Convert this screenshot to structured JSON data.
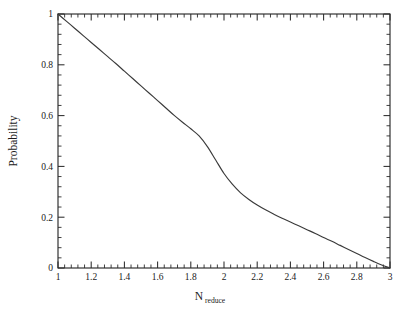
{
  "chart_data": {
    "type": "line",
    "title": "",
    "subtitle": "",
    "xlabel": "N_reduce",
    "xlabel_base": "N",
    "xlabel_subscript": "reduce",
    "ylabel": "Probability",
    "xlim": [
      1,
      3
    ],
    "ylim": [
      0,
      1
    ],
    "grid": false,
    "legend": null,
    "legend_position": "none",
    "x_ticks_major": [
      1,
      1.2,
      1.4,
      1.6,
      1.8,
      2,
      2.2,
      2.4,
      2.6,
      2.8,
      3
    ],
    "x_tick_labels": [
      "1",
      "1.2",
      "1.4",
      "1.6",
      "1.8",
      "2",
      "2.2",
      "2.4",
      "2.6",
      "2.8",
      "3"
    ],
    "x_minor_per_interval": 4,
    "y_ticks_major": [
      0,
      0.2,
      0.4,
      0.6,
      0.8,
      1
    ],
    "y_tick_labels": [
      "0",
      "0.2",
      "0.4",
      "0.6",
      "0.8",
      "1"
    ],
    "y_minor_per_interval": 4,
    "tick_direction": "in",
    "line_color": "#3a3a3a",
    "background_color": "#ffffff",
    "axis_color": "#2b2b2b",
    "series": [
      {
        "name": "Probability",
        "x": [
          1.0,
          1.05,
          1.1,
          1.15,
          1.2,
          1.25,
          1.3,
          1.35,
          1.4,
          1.45,
          1.5,
          1.55,
          1.6,
          1.65,
          1.7,
          1.75,
          1.8,
          1.85,
          1.9,
          1.95,
          2.0,
          2.05,
          2.1,
          2.15,
          2.2,
          2.25,
          2.3,
          2.35,
          2.4,
          2.45,
          2.5,
          2.55,
          2.6,
          2.65,
          2.7,
          2.75,
          2.8,
          2.85,
          2.9,
          2.95,
          3.0
        ],
        "y": [
          1.0,
          0.972,
          0.944,
          0.916,
          0.888,
          0.86,
          0.832,
          0.804,
          0.775,
          0.746,
          0.717,
          0.688,
          0.659,
          0.63,
          0.601,
          0.574,
          0.548,
          0.52,
          0.478,
          0.425,
          0.372,
          0.33,
          0.296,
          0.27,
          0.248,
          0.229,
          0.212,
          0.196,
          0.181,
          0.166,
          0.151,
          0.136,
          0.12,
          0.105,
          0.089,
          0.073,
          0.057,
          0.041,
          0.026,
          0.012,
          0.0
        ]
      }
    ]
  },
  "figure": {
    "plot_left_px": 58,
    "plot_right_px": 390,
    "plot_top_px": 14,
    "plot_bottom_px": 268
  }
}
